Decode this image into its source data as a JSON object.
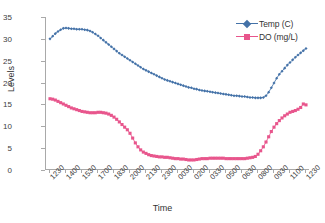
{
  "chart_data": {
    "type": "line",
    "title": "",
    "xlabel": "Time",
    "ylabel": "Levels",
    "ylim": [
      0,
      35
    ],
    "ytick_step": 5,
    "yticks": [
      0,
      5,
      10,
      15,
      20,
      25,
      30,
      35
    ],
    "grid": false,
    "legend_position": "top-right",
    "tick_labels_rotated": true,
    "xtick_labels": [
      "1230",
      "1400",
      "1530",
      "1700",
      "1830",
      "2000",
      "2130",
      "2300",
      "0030",
      "0200",
      "0330",
      "0500",
      "0630",
      "0800",
      "0930",
      "1100",
      "1230"
    ],
    "xtick_every_n_points": 6,
    "colors": {
      "temp": "#4472a8",
      "do": "#e8558c",
      "axis": "#a9a9a9",
      "text": "#404040",
      "background": "#ffffff"
    },
    "markers": {
      "temp": "diamond",
      "do": "square"
    },
    "series": [
      {
        "name": "Temp (C)",
        "unit": "C",
        "color": "#4472a8",
        "values": [
          30.0,
          30.6,
          31.2,
          31.7,
          32.1,
          32.4,
          32.5,
          32.4,
          32.3,
          32.3,
          32.2,
          32.2,
          32.2,
          32.1,
          32.0,
          31.8,
          31.5,
          31.1,
          30.7,
          30.2,
          29.7,
          29.2,
          28.7,
          28.2,
          27.7,
          27.2,
          26.7,
          26.3,
          25.9,
          25.5,
          25.1,
          24.7,
          24.3,
          23.9,
          23.5,
          23.1,
          22.8,
          22.5,
          22.2,
          21.9,
          21.6,
          21.3,
          21.0,
          20.7,
          20.5,
          20.3,
          20.1,
          19.9,
          19.7,
          19.5,
          19.3,
          19.1,
          18.9,
          18.8,
          18.6,
          18.5,
          18.3,
          18.2,
          18.1,
          18.0,
          17.9,
          17.8,
          17.7,
          17.6,
          17.5,
          17.4,
          17.3,
          17.2,
          17.1,
          17.0,
          17.0,
          16.9,
          16.8,
          16.8,
          16.7,
          16.6,
          16.6,
          16.5,
          16.5,
          16.5,
          16.6,
          17.0,
          17.8,
          18.8,
          19.9,
          21.0,
          21.9,
          22.6,
          23.3,
          24.0,
          24.6,
          25.2,
          25.8,
          26.3,
          26.8,
          27.3,
          27.8
        ]
      },
      {
        "name": "DO (mg/L)",
        "unit": "mg/L",
        "color": "#e8558c",
        "values": [
          16.3,
          16.2,
          16.0,
          15.7,
          15.4,
          15.1,
          14.8,
          14.5,
          14.2,
          14.0,
          13.8,
          13.6,
          13.4,
          13.3,
          13.2,
          13.1,
          13.1,
          13.1,
          13.2,
          13.2,
          13.1,
          13.0,
          12.8,
          12.5,
          12.1,
          11.6,
          11.0,
          10.4,
          9.8,
          9.2,
          8.4,
          7.3,
          6.2,
          5.3,
          4.6,
          4.1,
          3.8,
          3.5,
          3.3,
          3.2,
          3.1,
          3.0,
          3.0,
          2.9,
          2.9,
          2.8,
          2.7,
          2.6,
          2.6,
          2.5,
          2.5,
          2.4,
          2.3,
          2.3,
          2.3,
          2.4,
          2.5,
          2.6,
          2.6,
          2.6,
          2.7,
          2.7,
          2.7,
          2.7,
          2.7,
          2.7,
          2.6,
          2.6,
          2.6,
          2.6,
          2.6,
          2.6,
          2.6,
          2.6,
          2.7,
          2.8,
          2.9,
          3.1,
          3.6,
          4.4,
          5.3,
          6.4,
          7.6,
          8.8,
          9.8,
          10.6,
          11.3,
          11.9,
          12.4,
          12.8,
          13.2,
          13.4,
          13.6,
          13.9,
          14.3,
          15.1,
          14.9
        ]
      }
    ]
  },
  "legend": {
    "entries": [
      {
        "label": "Temp (C)"
      },
      {
        "label": "DO (mg/L)"
      }
    ]
  },
  "axes": {
    "x_title": "Time",
    "y_title": "Levels"
  }
}
